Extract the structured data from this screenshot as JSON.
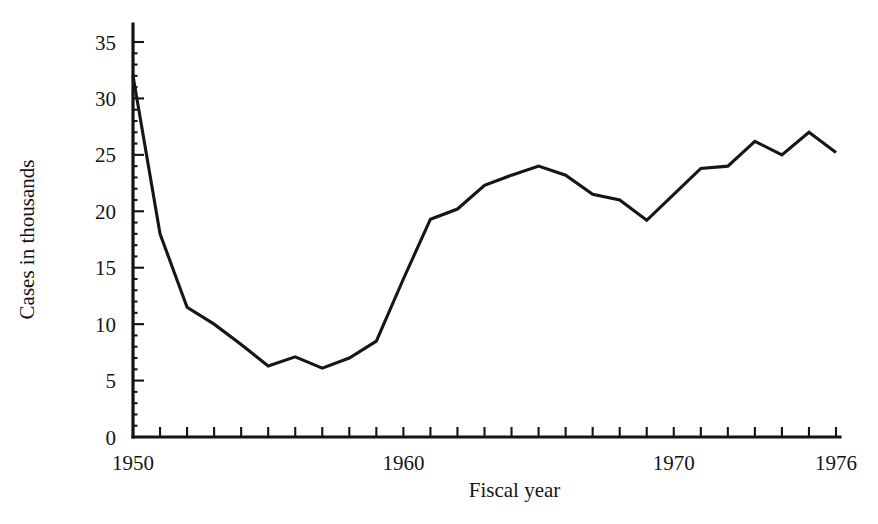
{
  "chart_data": {
    "type": "line",
    "title": "",
    "subtitle": "",
    "xlabel": "Fiscal year",
    "ylabel": "Cases in thousands",
    "xlim": [
      1950,
      1976
    ],
    "ylim": [
      0,
      35
    ],
    "grid": false,
    "legend": null,
    "x_tick_labels": [
      "1950",
      "1960",
      "1970",
      "1976"
    ],
    "x_tick_label_values": [
      1950,
      1960,
      1970,
      1976
    ],
    "x_minor_ticks": [
      1950,
      1951,
      1952,
      1953,
      1954,
      1955,
      1956,
      1957,
      1958,
      1959,
      1960,
      1961,
      1962,
      1963,
      1964,
      1965,
      1966,
      1967,
      1968,
      1969,
      1970,
      1971,
      1972,
      1973,
      1974,
      1975,
      1976
    ],
    "y_tick_labels": [
      "0",
      "5",
      "10",
      "15",
      "20",
      "25",
      "30",
      "35"
    ],
    "y_tick_values": [
      0,
      5,
      10,
      15,
      20,
      25,
      30,
      35
    ],
    "y_minor_step": 1,
    "line_color": "#161616",
    "axis_color": "#141414",
    "background_color": "#ffffff",
    "x": [
      1950,
      1951,
      1952,
      1953,
      1954,
      1955,
      1956,
      1957,
      1958,
      1959,
      1960,
      1961,
      1962,
      1963,
      1964,
      1965,
      1966,
      1967,
      1968,
      1969,
      1970,
      1971,
      1972,
      1973,
      1974,
      1975,
      1976
    ],
    "values": [
      32.0,
      18.0,
      11.5,
      10.0,
      8.2,
      6.3,
      7.1,
      6.1,
      7.0,
      8.5,
      14.0,
      19.3,
      20.2,
      22.3,
      23.2,
      24.0,
      23.2,
      21.5,
      21.0,
      19.2,
      21.5,
      23.8,
      24.0,
      26.2,
      25.0,
      27.0,
      25.2
    ]
  }
}
